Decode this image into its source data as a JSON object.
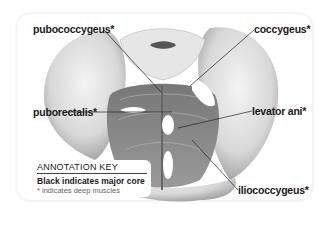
{
  "diagram": {
    "labels": [
      {
        "text": "pubococcygeus*"
      },
      {
        "text": "coccygeus*"
      },
      {
        "text": "puborectalis*"
      },
      {
        "text": "levator ani*"
      },
      {
        "text": "iliococcygeus*"
      }
    ],
    "key": {
      "title": "ANNOTATION KEY",
      "line1": "Black indicates major core",
      "line2": "* indicates deep muscles"
    }
  }
}
